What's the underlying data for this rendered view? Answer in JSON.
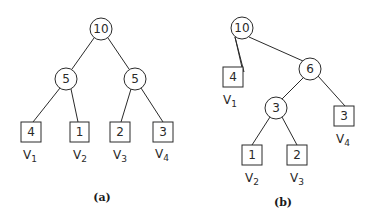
{
  "diagrams": [
    {
      "caption": "(a)",
      "root": {
        "value": "10"
      },
      "internal": [
        {
          "id": "a-l",
          "value": "5"
        },
        {
          "id": "a-r",
          "value": "5"
        }
      ],
      "leaves": [
        {
          "value": "4",
          "label": "V",
          "sub": "1"
        },
        {
          "value": "1",
          "label": "V",
          "sub": "2"
        },
        {
          "value": "2",
          "label": "V",
          "sub": "3"
        },
        {
          "value": "3",
          "label": "V",
          "sub": "4"
        }
      ]
    },
    {
      "caption": "(b)",
      "root": {
        "value": "10"
      },
      "internal": [
        {
          "id": "b-6",
          "value": "6"
        },
        {
          "id": "b-3",
          "value": "3"
        }
      ],
      "leaves": [
        {
          "value": "4",
          "label": "V",
          "sub": "1"
        },
        {
          "value": "1",
          "label": "V",
          "sub": "2"
        },
        {
          "value": "2",
          "label": "V",
          "sub": "3"
        },
        {
          "value": "3",
          "label": "V",
          "sub": "4"
        }
      ]
    }
  ]
}
